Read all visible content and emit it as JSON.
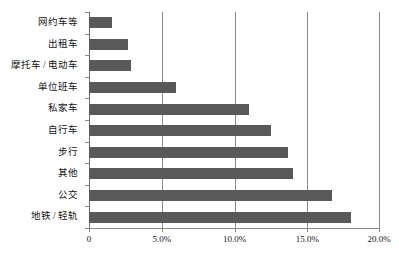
{
  "chart_data": {
    "type": "bar",
    "orientation": "horizontal",
    "title": "",
    "subtitle": "",
    "xlabel": "",
    "ylabel": "",
    "xlim": [
      0,
      20
    ],
    "xtick_labels": [
      "0",
      "5.0%",
      "10.0%",
      "15.0%",
      "20.0%"
    ],
    "xtick_values": [
      0,
      5,
      10,
      15,
      20
    ],
    "grid": "vertical",
    "legend": "none",
    "bar_color": "#595959",
    "categories": [
      "网约车等",
      "出租车",
      "摩托车 / 电动车",
      "单位班车",
      "私家车",
      "自行车",
      "步行",
      "其他",
      "公交",
      "地铁 / 轻轨"
    ],
    "values": [
      1.6,
      2.7,
      2.9,
      6.0,
      11.0,
      12.5,
      13.7,
      14.0,
      16.7,
      18.0
    ],
    "value_labels": [
      "1.6%",
      "2.7%",
      "2.9%",
      "6.0%",
      "11.0%",
      "12.5%",
      "13.7%",
      "14.0%",
      "16.7%",
      "18.0%"
    ]
  }
}
